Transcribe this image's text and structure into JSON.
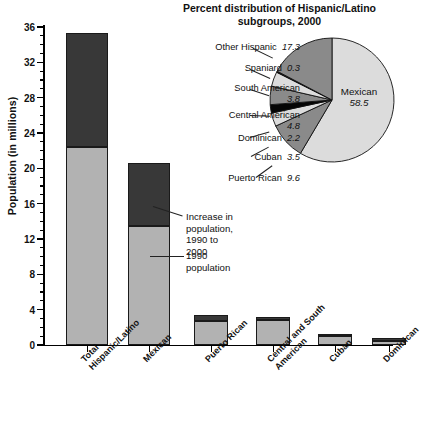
{
  "chart_data": [
    {
      "type": "bar",
      "title": "",
      "xlabel": "",
      "ylabel": "Population (in millions)",
      "ylim": [
        0,
        36
      ],
      "yticks": [
        0,
        4,
        8,
        12,
        16,
        20,
        24,
        28,
        32,
        36
      ],
      "grid": false,
      "stacked": true,
      "categories": [
        "Total\nHispanic/Latino",
        "Mexican",
        "Puerto Rican",
        "Central and South\nAmerican",
        "Cuban",
        "Dominican"
      ],
      "series": [
        {
          "name": "1990 population",
          "values": [
            22.4,
            13.5,
            2.7,
            2.8,
            1.0,
            0.5
          ]
        },
        {
          "name": "Increase in population, 1990 to 2000",
          "values": [
            12.9,
            7.1,
            0.7,
            0.4,
            0.2,
            0.3
          ]
        }
      ],
      "totals": [
        35.3,
        20.6,
        3.4,
        3.2,
        1.2,
        0.8
      ],
      "annotations": [
        "Increase in population,\n1990 to 2000",
        "1990 population"
      ],
      "colors": {
        "base": "#b2b2b2",
        "increase": "#383838",
        "outline": "#1a1a1a"
      }
    },
    {
      "type": "pie",
      "title": "Percent distribution of Hispanic/Latino subgroups, 2000",
      "unit": "percent",
      "start_angle_deg": 0,
      "direction": "clockwise",
      "labels": [
        "Mexican",
        "Puerto Rican",
        "Cuban",
        "Dominican",
        "Central American",
        "South American",
        "Spaniard",
        "Other Hispanic"
      ],
      "values": [
        58.5,
        9.6,
        3.5,
        2.2,
        4.8,
        3.8,
        0.3,
        17.3
      ],
      "colors": [
        "#dcdcdc",
        "#8a8a8a",
        "#dcdcdc",
        "#050505",
        "#8a8a8a",
        "#dcdcdc",
        "#050505",
        "#8a8a8a"
      ],
      "legend_position": "callout-labels"
    }
  ],
  "bar": {
    "y_axis_title": "Population (in millions)",
    "y_tick_labels": [
      "0",
      "4",
      "8",
      "12",
      "16",
      "20",
      "24",
      "28",
      "32",
      "36"
    ],
    "x_categories": [
      {
        "line1": "Total",
        "line2": "Hispanic/Latino"
      },
      {
        "line1": "Mexican",
        "line2": ""
      },
      {
        "line1": "Puerto Rican",
        "line2": ""
      },
      {
        "line1": "Central and South",
        "line2": "American"
      },
      {
        "line1": "Cuban",
        "line2": ""
      },
      {
        "line1": "Dominican",
        "line2": ""
      }
    ],
    "annotation_increase_line1": "Increase in population,",
    "annotation_increase_line2": "1990 to 2000",
    "annotation_base": "1990 population"
  },
  "pie": {
    "title_line1": "Percent distribution of Hispanic/Latino",
    "title_line2": "subgroups, 2000",
    "center_label_name": "Mexican",
    "center_label_value": "58.5",
    "callouts": [
      {
        "name": "Other Hispanic",
        "value": "17.3"
      },
      {
        "name": "Spaniard",
        "value": "0.3"
      },
      {
        "name": "South American",
        "value": "3.8"
      },
      {
        "name": "Central American",
        "value": "4.8"
      },
      {
        "name": "Dominican",
        "value": "2.2"
      },
      {
        "name": "Cuban",
        "value": "3.5"
      },
      {
        "name": "Puerto Rican",
        "value": "9.6"
      }
    ]
  }
}
